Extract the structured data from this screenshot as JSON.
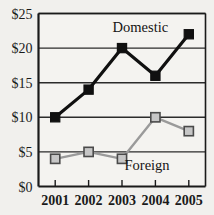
{
  "chart_data": {
    "type": "line",
    "title": "",
    "xlabel": "",
    "ylabel": "",
    "x": [
      "2001",
      "2002",
      "2003",
      "2004",
      "2005"
    ],
    "categories": [
      "2001",
      "2002",
      "2003",
      "2004",
      "2005"
    ],
    "series": [
      {
        "name": "Domestic",
        "values": [
          10,
          14,
          20,
          16,
          22
        ],
        "color": "#101010",
        "marker": "filled-square",
        "marker_fill": "#101010",
        "marker_stroke": "#101010"
      },
      {
        "name": "Foreign",
        "values": [
          4,
          5,
          4,
          10,
          8
        ],
        "color": "#9a9a9a",
        "marker": "square",
        "marker_fill": "#c6c6c6",
        "marker_stroke": "#4a4a4a"
      }
    ],
    "ylim": [
      0,
      25
    ],
    "ytick_values": [
      0,
      5,
      10,
      15,
      20,
      25
    ],
    "ytick_labels": [
      "$0",
      "$5",
      "$10",
      "$15",
      "$20",
      "$25"
    ],
    "grid": true,
    "grid_axis": "y",
    "legend": "none",
    "annotations": [
      {
        "text": "Domestic",
        "x": 2003.55,
        "y": 23.0
      },
      {
        "text": "Foreign",
        "x": 2003.75,
        "y": 3.1
      }
    ],
    "colors": {
      "background": "#f1f0ed",
      "plot_background": "#f4f3f0",
      "axis": "#1a1a1a",
      "grid": "#2b2b2b",
      "domestic": "#101010",
      "foreign": "#9a9a9a"
    }
  }
}
